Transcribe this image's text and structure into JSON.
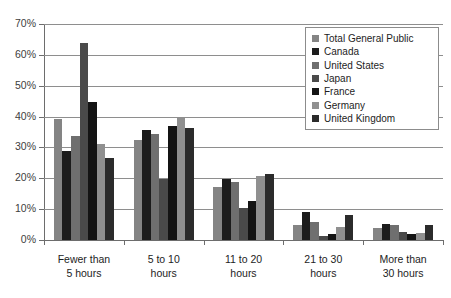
{
  "chart_data": {
    "type": "bar",
    "title": "",
    "subtitle": "",
    "xlabel": "",
    "ylabel": "",
    "ylim": [
      0,
      70
    ],
    "ytick_labels": [
      "0%",
      "10%",
      "20%",
      "30%",
      "40%",
      "50%",
      "60%",
      "70%"
    ],
    "ytick_values": [
      0,
      10,
      20,
      30,
      40,
      50,
      60,
      70
    ],
    "grid": true,
    "legend_position": "top-right",
    "categories": [
      "Fewer than\n5 hours",
      "5 to 10\nhours",
      "11 to 20\nhours",
      "21 to 30\nhours",
      "More than\n30 hours"
    ],
    "series": [
      {
        "name": "Total General Public",
        "color": "#848484",
        "values": [
          39.3,
          32.5,
          17.2,
          4.9,
          4.0
        ]
      },
      {
        "name": "Canada",
        "color": "#1c1c1c",
        "values": [
          28.7,
          35.5,
          19.7,
          9.0,
          5.1
        ]
      },
      {
        "name": "United States",
        "color": "#6f6f6f",
        "values": [
          33.7,
          34.5,
          18.9,
          6.0,
          4.9
        ]
      },
      {
        "name": "Japan",
        "color": "#4a4a4a",
        "values": [
          63.9,
          19.8,
          10.4,
          1.4,
          2.7
        ]
      },
      {
        "name": "France",
        "color": "#141414",
        "values": [
          44.8,
          36.9,
          12.5,
          2.1,
          1.8
        ]
      },
      {
        "name": "Germany",
        "color": "#909090",
        "values": [
          31.1,
          39.4,
          20.8,
          4.2,
          2.4
        ]
      },
      {
        "name": "United Kingdom",
        "color": "#2b2b2b",
        "values": [
          26.7,
          36.4,
          21.4,
          8.1,
          4.9
        ]
      }
    ]
  },
  "legend": {
    "items": [
      {
        "label": "Total General Public"
      },
      {
        "label": "Canada"
      },
      {
        "label": "United States"
      },
      {
        "label": "Japan"
      },
      {
        "label": "France"
      },
      {
        "label": "Germany"
      },
      {
        "label": "United Kingdom"
      }
    ]
  }
}
